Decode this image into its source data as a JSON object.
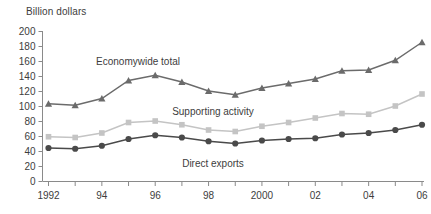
{
  "chart": {
    "y_axis_title": "Billion dollars",
    "y_ticks": [
      "200",
      "180",
      "160",
      "140",
      "120",
      "100",
      "80",
      "60",
      "40",
      "20",
      "0"
    ],
    "x_ticks": [
      "1992",
      "",
      "94",
      "",
      "96",
      "",
      "98",
      "",
      "2000",
      "",
      "02",
      "",
      "04",
      "",
      "06"
    ],
    "x_tick_labels_visible": [
      "1992",
      "94",
      "96",
      "98",
      "2000",
      "02",
      "04",
      "06"
    ],
    "labels": {
      "economywide": "Economywide total",
      "supporting": "Supporting activity",
      "direct": "Direct exports"
    },
    "colors": {
      "economywide": "#6b6b6b",
      "supporting": "#c4c4c4",
      "direct": "#4a4a4a",
      "axis": "#8a8a8a",
      "text": "#3d3d3d",
      "background": "#ffffff"
    }
  },
  "chart_data": {
    "type": "line",
    "title": "",
    "subtitle": "",
    "xlabel": "",
    "ylabel": "Billion dollars",
    "ylim": [
      0,
      200
    ],
    "ytick_values": [
      0,
      20,
      40,
      60,
      80,
      100,
      120,
      140,
      160,
      180,
      200
    ],
    "grid": false,
    "legend": "inline-annotations",
    "x": [
      1992,
      1993,
      1994,
      1995,
      1996,
      1997,
      1998,
      1999,
      2000,
      2001,
      2002,
      2003,
      2004,
      2005,
      2006
    ],
    "categories": [
      "1992",
      "1993",
      "1994",
      "1995",
      "1996",
      "1997",
      "1998",
      "1999",
      "2000",
      "2001",
      "2002",
      "2003",
      "2004",
      "2005",
      "2006"
    ],
    "series": [
      {
        "name": "Economywide total",
        "marker": "triangle",
        "color": "#6b6b6b",
        "values": [
          103,
          101,
          110,
          134,
          141,
          132,
          120,
          115,
          124,
          130,
          136,
          147,
          148,
          161,
          185
        ]
      },
      {
        "name": "Supporting activity",
        "marker": "square",
        "color": "#c4c4c4",
        "values": [
          59,
          58,
          64,
          78,
          80,
          75,
          68,
          66,
          73,
          78,
          84,
          90,
          89,
          100,
          116
        ]
      },
      {
        "name": "Direct exports",
        "marker": "circle",
        "color": "#4a4a4a",
        "values": [
          44,
          43,
          47,
          56,
          61,
          58,
          53,
          50,
          54,
          56,
          57,
          62,
          64,
          68,
          75
        ]
      }
    ]
  }
}
